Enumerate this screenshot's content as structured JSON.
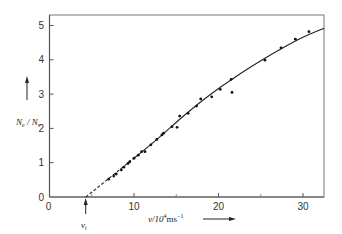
{
  "chart_data": {
    "type": "scatter",
    "title": "",
    "xlabel": "v / 10^4 ms^-1",
    "ylabel": "N_e / N_v",
    "xlim": [
      0,
      32.5
    ],
    "ylim": [
      0,
      5.2
    ],
    "grid": false,
    "legend": null,
    "x_ticks": [
      0,
      10,
      20,
      30
    ],
    "x_minor_ticks": [
      5,
      15,
      25
    ],
    "y_ticks": [
      0,
      1,
      2,
      3,
      4,
      5
    ],
    "annotations": [
      {
        "label": "v_t",
        "x": 4.3,
        "y": 0,
        "arrow": "up"
      }
    ],
    "series": [
      {
        "name": "measured",
        "kind": "points",
        "x": [
          7.0,
          7.6,
          7.9,
          8.5,
          8.8,
          9.3,
          9.5,
          10.0,
          10.5,
          10.9,
          11.3,
          12.0,
          12.7,
          13.3,
          13.5,
          14.5,
          15.1,
          15.4,
          16.4,
          17.4,
          17.9,
          19.2,
          20.2,
          21.5,
          21.6,
          25.5,
          27.4,
          29.1,
          30.7
        ],
        "y": [
          0.52,
          0.61,
          0.67,
          0.79,
          0.87,
          0.98,
          1.03,
          1.13,
          1.22,
          1.32,
          1.32,
          1.52,
          1.68,
          1.81,
          1.86,
          2.05,
          2.03,
          2.36,
          2.44,
          2.65,
          2.86,
          2.92,
          3.14,
          3.43,
          3.05,
          3.99,
          4.35,
          4.6,
          4.82
        ]
      },
      {
        "name": "extrapolation",
        "kind": "dashed-line",
        "x": [
          4.3,
          10.0
        ],
        "y": [
          0.0,
          1.13
        ]
      },
      {
        "name": "fit",
        "kind": "solid-line",
        "x": [
          10.0,
          13.0,
          16.0,
          19.0,
          22.0,
          25.0,
          28.0,
          30.0,
          32.5
        ],
        "y": [
          1.13,
          1.74,
          2.39,
          2.98,
          3.5,
          3.97,
          4.4,
          4.66,
          4.92
        ]
      }
    ]
  },
  "axes": {
    "x_title": "v/10",
    "x_exp": "4",
    "x_unit": "ms",
    "x_unit_exp": "−1",
    "y_title_main": "N",
    "y_sub1": "e",
    "y_sub2": "v",
    "vt_main": "v",
    "vt_sub": "t"
  }
}
